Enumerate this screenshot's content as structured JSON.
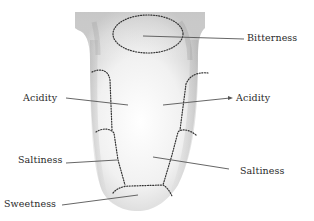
{
  "diagram": {
    "labels": {
      "bitterness": "Bitterness",
      "acidity_left": "Acidity",
      "acidity_right": "Acidity",
      "saltiness_left": "Saltiness",
      "saltiness_right": "Saltiness",
      "sweetness": "Sweetness"
    },
    "colors": {
      "background": "#ffffff",
      "tongue_light": "#f4f4f4",
      "tongue_shadow": "#b5b5b5",
      "dotted_boundary": "#333333",
      "leader_line": "#555555",
      "text": "#2a2a2a"
    }
  }
}
